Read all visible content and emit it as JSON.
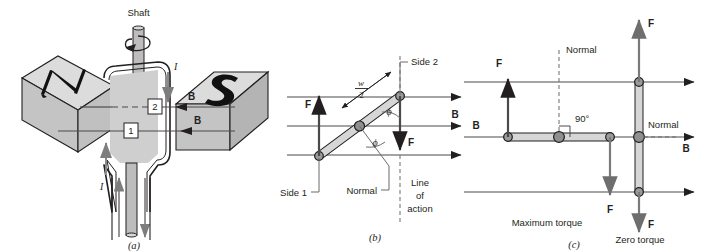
{
  "figure": {
    "colors": {
      "ink": "#231f20",
      "magnet_top": "#dcdcdc",
      "magnet_front": "#c9c9c9",
      "magnet_side": "#b9b9b9",
      "coil_fill": "#cfcfcf",
      "shaft_fill": "#bdbdbd",
      "bar_fill": "#d6d6d6",
      "pivot_fill": "#9a9a9a"
    }
  },
  "panel_a": {
    "caption": "(a)",
    "shaft_label": "Shaft",
    "magnet_north_label": "N",
    "magnet_south_label": "S",
    "side_markers": [
      "1",
      "2"
    ],
    "current_labels": [
      "I",
      "I"
    ],
    "field_labels": [
      "B",
      "B"
    ],
    "rotation_arrow": "curved-rotation-arrow"
  },
  "panel_b": {
    "caption": "(b)",
    "labels": {
      "side1": "Side 1",
      "side2": "Side 2",
      "normal": "Normal",
      "line_of_action": [
        "Line",
        "of",
        "action"
      ],
      "force_up": "F",
      "force_down": "F",
      "field": "B",
      "half_width_numerator": "w",
      "half_width_denominator": "2",
      "angle_upper": "ϕ",
      "angle_lower": "ϕ"
    }
  },
  "panel_c": {
    "caption": "(c)",
    "labels": {
      "normal_left": "Normal",
      "normal_right": "Normal",
      "right_angle": "90°",
      "field_left": "B",
      "field_right": "B",
      "force_left_up": "F",
      "force_mid_down": "F",
      "force_top_up": "F",
      "force_bottom_down": "F",
      "maximum_torque": "Maximum torque",
      "zero_torque": "Zero torque"
    }
  }
}
